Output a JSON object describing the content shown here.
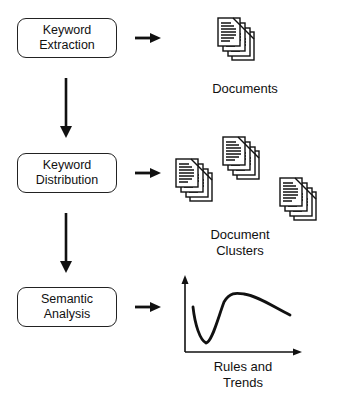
{
  "steps": [
    {
      "line1": "Keyword",
      "line2": "Extraction"
    },
    {
      "line1": "Keyword",
      "line2": "Distribution"
    },
    {
      "line1": "Semantic",
      "line2": "Analysis"
    }
  ],
  "outputs": [
    {
      "label": "Documents",
      "icon": "document-stack-icon"
    },
    {
      "label_line1": "Document",
      "label_line2": "Clusters",
      "icon": "document-clusters-icon"
    },
    {
      "label_line1": "Rules and",
      "label_line2": "Trends",
      "icon": "trend-chart-icon"
    }
  ],
  "colors": {
    "stroke": "#111111",
    "background": "#ffffff"
  }
}
